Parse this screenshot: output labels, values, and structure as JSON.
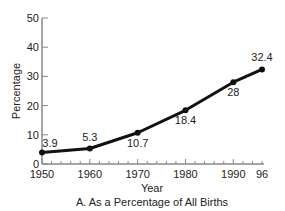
{
  "chart_data": {
    "type": "line",
    "title": "A. As a Percentage of All Births",
    "xlabel": "Year",
    "ylabel": "Percentage",
    "x": [
      1950,
      1960,
      1970,
      1980,
      1990,
      1996
    ],
    "values": [
      3.9,
      5.3,
      10.7,
      18.4,
      28,
      32.4
    ],
    "point_labels": [
      "3.9",
      "5.3",
      "10.7",
      "18.4",
      "28",
      "32.4"
    ],
    "xticks": [
      "1950",
      "1960",
      "1970",
      "1980",
      "1990",
      "96"
    ],
    "yticks": [
      "0",
      "10",
      "20",
      "30",
      "40",
      "50"
    ],
    "ylim": [
      0,
      50
    ],
    "xlim": [
      1950,
      1996
    ],
    "grid": false,
    "legend": null,
    "colors": {
      "line": "#111111",
      "axis": "#888888"
    }
  }
}
